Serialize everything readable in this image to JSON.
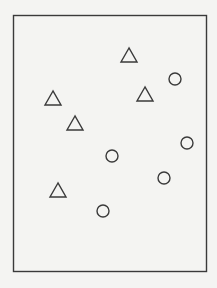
{
  "figure": {
    "frame": {
      "x": 13.5,
      "y": 15.5,
      "width": 193,
      "height": 256
    },
    "stroke_color": "#3a3a3a",
    "background_color": "#f4f4f2",
    "marker_styles": {
      "triangle": {
        "width": 16,
        "height": 14
      },
      "circle": {
        "radius": 6
      }
    },
    "classes": [
      {
        "name": "triangle",
        "points": [
          {
            "x": 129,
            "y": 55
          },
          {
            "x": 53,
            "y": 98
          },
          {
            "x": 145,
            "y": 94
          },
          {
            "x": 75,
            "y": 123
          },
          {
            "x": 58,
            "y": 190
          }
        ]
      },
      {
        "name": "circle",
        "points": [
          {
            "x": 175,
            "y": 79
          },
          {
            "x": 187,
            "y": 143
          },
          {
            "x": 112,
            "y": 156
          },
          {
            "x": 164,
            "y": 178
          },
          {
            "x": 103,
            "y": 211
          }
        ]
      }
    ]
  }
}
